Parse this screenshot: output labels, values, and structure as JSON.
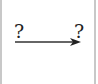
{
  "diagram": {
    "type": "arrow-mapping",
    "source": {
      "label": "?"
    },
    "target": {
      "label": "?"
    },
    "arrow": {
      "direction": "right",
      "color": "#333333"
    },
    "frame_color": "#c8c8c8"
  }
}
